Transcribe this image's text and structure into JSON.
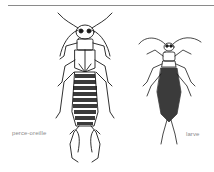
{
  "figure": {
    "labels": {
      "adult": "perce-oreille",
      "larva": "larve"
    },
    "colors": {
      "ink": "#1a1a1a",
      "label": "#8c8c8c",
      "rule": "#8a8a8a"
    }
  }
}
